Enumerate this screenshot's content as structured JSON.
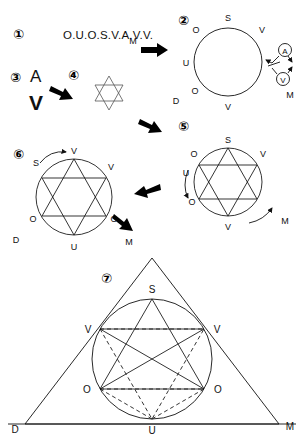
{
  "figure": {
    "background_color": "#ffffff",
    "line_color": "#111111",
    "arrow_color": "#000000"
  },
  "steps": [
    {
      "id": "step-1",
      "marker": "①"
    },
    {
      "id": "step-2",
      "marker": "②"
    },
    {
      "id": "step-3",
      "marker": "③"
    },
    {
      "id": "step-4",
      "marker": "④"
    },
    {
      "id": "step-5",
      "marker": "⑤"
    },
    {
      "id": "step-6",
      "marker": "⑥"
    },
    {
      "id": "step-7",
      "marker": "⑦"
    }
  ],
  "panel1": {
    "marker": "①",
    "cipher": "O.U.O.S.V.A.V.V."
  },
  "panel3": {
    "marker": "③",
    "letter_top": "A",
    "letter_bottom": "V"
  },
  "panel4": {
    "marker": "④",
    "shape": "hexagram"
  },
  "panel2": {
    "marker": "②",
    "shape": "circle",
    "labels": {
      "top": "S",
      "upper_left": "O",
      "upper_right": "V",
      "left": "U",
      "lower_left": "O",
      "bottom": "V",
      "outer_lower_left": "D",
      "outer_lower_right": "M"
    },
    "callouts": [
      {
        "name": "circled-a",
        "text": "A"
      },
      {
        "name": "circled-v",
        "text": "V"
      }
    ]
  },
  "panel5": {
    "marker": "⑤",
    "shape": "hexagram-in-circle",
    "labels": {
      "top": "S",
      "upper_left": "O",
      "upper_right": "V",
      "left": "U",
      "lower_left": "O",
      "bottom": "V",
      "outer_right": "M"
    }
  },
  "panel6": {
    "marker": "⑥",
    "shape": "hexagram-in-circle",
    "labels": {
      "top": "V",
      "upper_left": "S",
      "upper_right": "V",
      "left": "O",
      "right": "O",
      "bottom": "U",
      "outer_lower_left": "D",
      "outer_lower_right": "M"
    }
  },
  "panel7": {
    "marker": "⑦",
    "shape": "triangle-with-inscribed-circle-and-star",
    "labels": {
      "apex": "S",
      "upper_left": "V",
      "upper_right": "V",
      "lower_left": "O",
      "lower_right": "O",
      "bottom": "U",
      "corner_left": "D",
      "corner_right": "M"
    }
  },
  "arrows": [
    {
      "name": "arrow-1-to-2",
      "direction": "right",
      "label": "M"
    },
    {
      "name": "arrow-3-to-4",
      "direction": "down-right",
      "label": ""
    },
    {
      "name": "arrow-2-to-5",
      "direction": "down-right",
      "label": ""
    },
    {
      "name": "arrow-5-to-6",
      "direction": "left",
      "label": ""
    },
    {
      "name": "arrow-6-to-7",
      "direction": "down-right",
      "label": ""
    }
  ]
}
